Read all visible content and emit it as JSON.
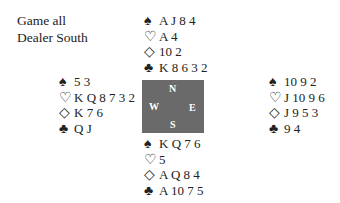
{
  "info": {
    "vulnerability": "Game all",
    "dealer": "Dealer South"
  },
  "compass": {
    "n": "N",
    "w": "W",
    "e": "E",
    "s": "S"
  },
  "suits": {
    "spades": "♠",
    "hearts": "♡",
    "diamonds": "◇",
    "clubs": "♣"
  },
  "hands": {
    "north": {
      "spades": "A J 8 4",
      "hearts": "A 4",
      "diamonds": "10 2",
      "clubs": "K 8 6 3 2"
    },
    "west": {
      "spades": "5 3",
      "hearts": "K Q 8 7 3 2",
      "diamonds": "K 7 6",
      "clubs": "Q J"
    },
    "east": {
      "spades": "10 9 2",
      "hearts": "J 10 9 6",
      "diamonds": "J 9 5 3",
      "clubs": "9 4"
    },
    "south": {
      "spades": "K Q 7 6",
      "hearts": "5",
      "diamonds": "A Q 8 4",
      "clubs": "A 10 7 5"
    }
  }
}
